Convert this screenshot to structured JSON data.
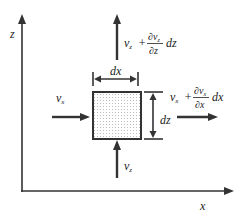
{
  "diagram": {
    "axes": {
      "x_label": "x",
      "z_label": "z"
    },
    "element": {
      "width_label": "dx",
      "height_label": "dz",
      "fill_pattern": "dotted"
    },
    "flows": {
      "inflow_x": {
        "symbol": "v",
        "subscript": "x"
      },
      "inflow_z": {
        "symbol": "v",
        "subscript": "z"
      },
      "outflow_x": {
        "base": "v",
        "base_sub": "x",
        "plus": "+",
        "numerator": "∂v",
        "numerator_sub": "x",
        "denominator": "∂x",
        "differential": "dx"
      },
      "outflow_z": {
        "base": "v",
        "base_sub": "z",
        "plus": "+",
        "numerator": "∂v",
        "numerator_sub": "z",
        "denominator": "∂z",
        "differential": "dz"
      }
    },
    "colors": {
      "stroke": "#333333",
      "background": "#ffffff",
      "dots": "#777777"
    }
  }
}
